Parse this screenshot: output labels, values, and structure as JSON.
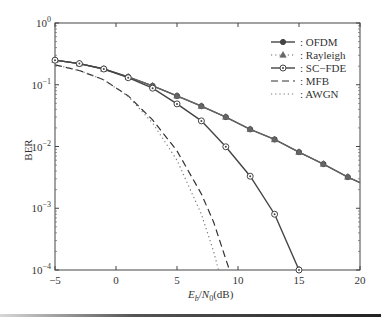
{
  "chart_data": {
    "type": "line",
    "title": "",
    "xlabel": "E_b/N_0(dB)",
    "xlabel_parts": {
      "E": "E",
      "b": "b",
      "slash": "/",
      "N": "N",
      "zero": "0",
      "unit": "(dB)"
    },
    "ylabel": "BER",
    "xlim": [
      -5,
      20
    ],
    "ylim": [
      0.0001,
      1
    ],
    "yscale": "log",
    "grid": false,
    "legend_position": "top-right",
    "x_ticks": [
      -5,
      0,
      5,
      10,
      15,
      20
    ],
    "x_tick_labels": [
      "−5",
      "0",
      "5",
      "10",
      "15",
      "20"
    ],
    "y_ticks": [
      1,
      0.1,
      0.01,
      0.001,
      0.0001
    ],
    "y_tick_labels": [
      {
        "base": "10",
        "exp": "0"
      },
      {
        "base": "10",
        "exp": "−1"
      },
      {
        "base": "10",
        "exp": "−2"
      },
      {
        "base": "10",
        "exp": "−3"
      },
      {
        "base": "10",
        "exp": "−4"
      }
    ],
    "series": [
      {
        "name": ": OFDM",
        "style": "solid",
        "marker": "filled-circle",
        "color": "#444444",
        "x": [
          -5,
          -3,
          -1,
          1,
          3,
          5,
          7,
          9,
          11,
          13,
          15,
          17,
          19,
          20
        ],
        "y": [
          0.25,
          0.22,
          0.18,
          0.134,
          0.096,
          0.066,
          0.045,
          0.03,
          0.019,
          0.013,
          0.0081,
          0.0052,
          0.0032,
          0.0026
        ]
      },
      {
        "name": ": Rayleigh",
        "style": "none",
        "marker": "triangle",
        "color": "#666666",
        "x": [
          -5,
          -3,
          -1,
          1,
          3,
          5,
          7,
          9,
          11,
          13,
          15,
          17,
          19,
          20
        ],
        "y": [
          0.25,
          0.22,
          0.18,
          0.134,
          0.096,
          0.066,
          0.045,
          0.03,
          0.019,
          0.013,
          0.0081,
          0.0052,
          0.0032,
          0.0026
        ]
      },
      {
        "name": ": SC−FDE",
        "style": "solid",
        "marker": "open-circle",
        "color": "#444444",
        "x": [
          -5,
          -3,
          -1,
          1,
          3,
          5,
          7,
          9,
          11,
          13,
          15
        ],
        "y": [
          0.25,
          0.22,
          0.18,
          0.13,
          0.088,
          0.049,
          0.026,
          0.0099,
          0.0033,
          0.0008,
          0.0001
        ]
      },
      {
        "name": ": MFB",
        "style": "dashed",
        "marker": "none",
        "color": "#333333",
        "x": [
          -5,
          -3,
          -1,
          1,
          3,
          5,
          7,
          8,
          9,
          9.3
        ],
        "y": [
          0.21,
          0.17,
          0.12,
          0.066,
          0.027,
          0.0085,
          0.0017,
          0.0006,
          0.00015,
          0.0001
        ]
      },
      {
        "name": ": AWGN",
        "style": "dotted",
        "marker": "none",
        "color": "#777777",
        "x": [
          -5,
          -3,
          -1,
          1,
          3,
          5,
          7,
          8,
          8.4
        ],
        "y": [
          0.21,
          0.17,
          0.12,
          0.065,
          0.024,
          0.006,
          0.0008,
          0.0002,
          0.0001
        ]
      }
    ]
  }
}
